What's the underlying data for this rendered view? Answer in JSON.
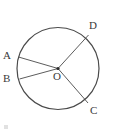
{
  "figure": {
    "type": "geometry-diagram",
    "background_color": "#ffffff",
    "stroke_color": "#4a4a4a",
    "label_color": "#3a3a3a"
  },
  "circle": {
    "center_x": 58,
    "center_y": 68.5,
    "radius": 41,
    "stroke_width": 1.2
  },
  "center_point": {
    "label": "O",
    "x": 58,
    "y": 68.5,
    "dot_radius": 1.6
  },
  "radii": [
    {
      "label": "A",
      "end_x": 18.5,
      "end_y": 57.0,
      "label_x": 3,
      "label_y": 50
    },
    {
      "label": "B",
      "end_x": 19.5,
      "end_y": 79.0,
      "label_x": 3,
      "label_y": 73
    },
    {
      "label": "C",
      "end_x": 88.0,
      "end_y": 103.0,
      "label_x": 90,
      "label_y": 105
    },
    {
      "label": "D",
      "end_x": 88.5,
      "end_y": 35.0,
      "label_x": 89,
      "label_y": 20
    }
  ],
  "labels": {
    "a": "A",
    "b": "B",
    "c": "C",
    "d": "D",
    "o": "O"
  }
}
